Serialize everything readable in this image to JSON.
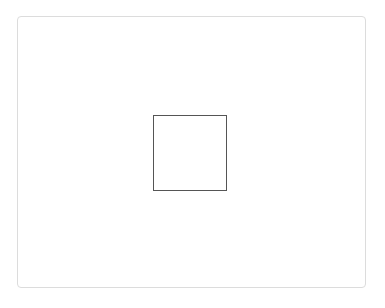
{
  "canvas": {
    "panel": {
      "border_color": "#dcdcdc",
      "background": "#ffffff"
    },
    "shape": {
      "type": "square",
      "border_color": "#555555"
    }
  },
  "caption": {
    "text": ""
  }
}
